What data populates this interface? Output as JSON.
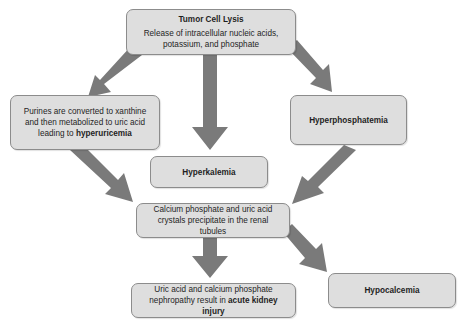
{
  "diagram": {
    "nodes": {
      "tumor_cell_lysis": {
        "title": "Tumor Cell Lysis",
        "text": "Release of intracellular nucleic acids, potassium, and phosphate"
      },
      "purines": {
        "text": "Purines are converted to xanthine and then metabolized to uric acid leading to",
        "bold": "hyperuricemia"
      },
      "hyperphosphatemia": {
        "bold": "Hyperphosphatemia"
      },
      "hyperkalemia": {
        "bold": "Hyperkalemia"
      },
      "crystals": {
        "text": "Calcium phosphate and uric acid crystals precipitate in the renal tubules"
      },
      "aki": {
        "text": "Uric acid and calcium phosphate nephropathy result in",
        "bold": "acute kidney injury"
      },
      "hypocalcemia": {
        "bold": "Hypocalcemia"
      }
    },
    "edges": [
      {
        "from": "tumor_cell_lysis",
        "to": "purines"
      },
      {
        "from": "tumor_cell_lysis",
        "to": "hyperkalemia"
      },
      {
        "from": "tumor_cell_lysis",
        "to": "hyperphosphatemia"
      },
      {
        "from": "purines",
        "to": "crystals"
      },
      {
        "from": "hyperphosphatemia",
        "to": "crystals"
      },
      {
        "from": "crystals",
        "to": "aki"
      },
      {
        "from": "crystals",
        "to": "hypocalcemia"
      }
    ],
    "colors": {
      "box_fill": "#dedede",
      "box_border": "#8c8c8c",
      "arrow": "#7a7a7a",
      "text": "#1e1e1e"
    }
  }
}
